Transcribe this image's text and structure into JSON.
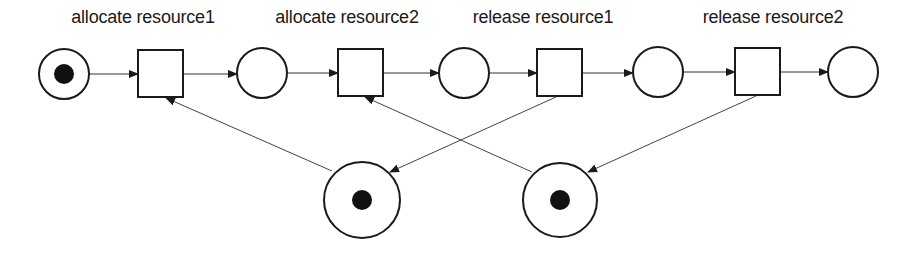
{
  "diagram": {
    "type": "petri-net",
    "colors": {
      "stroke": "#1a1a1a",
      "token": "#111111",
      "background": "#ffffff"
    },
    "transitions": [
      {
        "id": "t1",
        "label": "allocate resource1"
      },
      {
        "id": "t2",
        "label": "allocate resource2"
      },
      {
        "id": "t3",
        "label": "release resource1"
      },
      {
        "id": "t4",
        "label": "release resource2"
      }
    ],
    "places": [
      {
        "id": "p1",
        "tokens": 1
      },
      {
        "id": "p2",
        "tokens": 0
      },
      {
        "id": "p3",
        "tokens": 0
      },
      {
        "id": "p4",
        "tokens": 0
      },
      {
        "id": "p5",
        "tokens": 0
      },
      {
        "id": "resource1",
        "tokens": 1
      },
      {
        "id": "resource2",
        "tokens": 1
      }
    ],
    "arcs": [
      [
        "p1",
        "t1"
      ],
      [
        "t1",
        "p2"
      ],
      [
        "p2",
        "t2"
      ],
      [
        "t2",
        "p3"
      ],
      [
        "p3",
        "t3"
      ],
      [
        "t3",
        "p4"
      ],
      [
        "p4",
        "t4"
      ],
      [
        "t4",
        "p5"
      ],
      [
        "resource1",
        "t1"
      ],
      [
        "t3",
        "resource1"
      ],
      [
        "resource2",
        "t2"
      ],
      [
        "t4",
        "resource2"
      ]
    ]
  }
}
